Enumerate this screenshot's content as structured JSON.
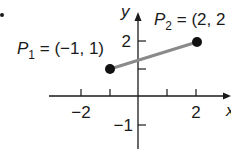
{
  "diagram": {
    "type": "coordinate-plane-segment",
    "axes": {
      "x_label": "x",
      "y_label": "y",
      "x_ticks": [
        {
          "value": -2,
          "label": "−2"
        },
        {
          "value": -1,
          "label": ""
        },
        {
          "value": 1,
          "label": ""
        },
        {
          "value": 2,
          "label": "2"
        }
      ],
      "y_ticks": [
        {
          "value": 2,
          "label": "2"
        },
        {
          "value": 1,
          "label": ""
        },
        {
          "value": -1,
          "label": "−1"
        }
      ]
    },
    "points": [
      {
        "name": "P",
        "sub": "1",
        "label_rest": " = (−1, 1)",
        "x": -1,
        "y": 1
      },
      {
        "name": "P",
        "sub": "2",
        "label_rest": " = (2, 2",
        "x": 2,
        "y": 2
      }
    ],
    "segment": {
      "from": "P1",
      "to": "P2",
      "color": "#8a8a8a"
    },
    "colors": {
      "axis": "#1a1a1a",
      "point": "#111111",
      "segment": "#8a8a8a"
    }
  }
}
